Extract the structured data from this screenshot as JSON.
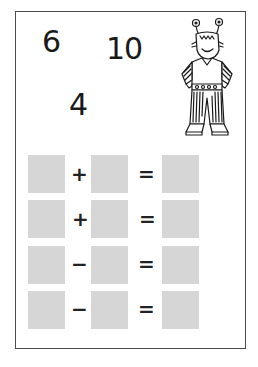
{
  "worksheet": {
    "given_numbers": [
      {
        "id": "n6",
        "value": "6"
      },
      {
        "id": "n10",
        "value": "10"
      },
      {
        "id": "n4",
        "value": "4"
      }
    ],
    "character": "alien-monster-illustration",
    "equations": [
      {
        "operator": "+",
        "equals": "=",
        "answers": [
          "",
          "",
          ""
        ]
      },
      {
        "operator": "+",
        "equals": "=",
        "answers": [
          "",
          "",
          ""
        ]
      },
      {
        "operator": "−",
        "equals": "=",
        "answers": [
          "",
          "",
          ""
        ]
      },
      {
        "operator": "−",
        "equals": "=",
        "answers": [
          "",
          "",
          ""
        ]
      }
    ],
    "colors": {
      "border": "#4a4a4a",
      "answer_box": "#d6d6d6",
      "text": "#1a1a1a"
    }
  }
}
